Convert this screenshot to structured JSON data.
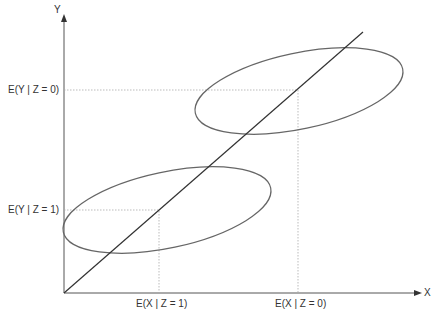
{
  "axes": {
    "x_label": "X",
    "y_label": "Y"
  },
  "labels": {
    "ey_z0": "E(Y | Z = 0)",
    "ey_z1": "E(Y | Z = 1)",
    "ex_z1": "E(X | Z = 1)",
    "ex_z0": "E(X | Z = 0)"
  },
  "colors": {
    "axis": "#333333",
    "ellipse": "#666666",
    "guide": "#aaaaaa"
  }
}
